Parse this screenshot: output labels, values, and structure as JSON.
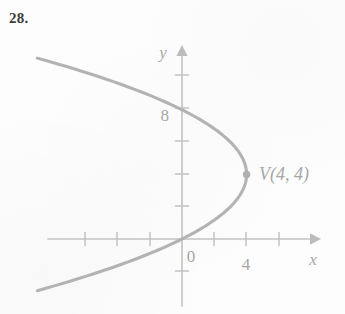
{
  "figure": {
    "exercise_number": "28.",
    "background_color": "#fdfdfd",
    "curve_color": "#b3b3b3",
    "axis_color": "#c2c2c2",
    "text_color": "#a6a6a6",
    "number_color": "#3c3c3c"
  },
  "axes": {
    "x_label": "x",
    "y_label": "y",
    "origin_label": "0",
    "x_tick_label": "4",
    "y_tick_label": "8",
    "x_range": [
      -8,
      8
    ],
    "y_range": [
      -4,
      12
    ],
    "tick_interval": 2,
    "grid": false,
    "arrowheads": [
      "x-positive",
      "y-positive"
    ]
  },
  "annotations": [
    {
      "name": "vertex",
      "label": "V(4, 4)",
      "x": 4,
      "y": 4,
      "marker": "dot"
    }
  ],
  "chart_data": {
    "type": "line",
    "title": "",
    "subtitle": "",
    "xlabel": "x",
    "ylabel": "y",
    "xlim": [
      -8,
      8
    ],
    "ylim": [
      -4,
      12
    ],
    "grid": false,
    "legend": "none",
    "tick_labels": {
      "x": [
        "0",
        "4"
      ],
      "y": [
        "8"
      ]
    },
    "curve": {
      "name": "leftward parabola with vertex V(4, 4)",
      "equation": "x = 4 - (1/4)(y - 4)^2",
      "orientation": "opens-left",
      "vertex": [
        4,
        4
      ],
      "y_intercepts": [
        0,
        8
      ],
      "x_intercept": 0,
      "points": [
        [
          -8.0,
          -3.0
        ],
        [
          -5.1,
          -2.0
        ],
        [
          -2.3,
          -1.0
        ],
        [
          0.0,
          0.0
        ],
        [
          1.8,
          1.0
        ],
        [
          3.0,
          2.0
        ],
        [
          3.8,
          3.0
        ],
        [
          4.0,
          4.0
        ],
        [
          3.8,
          5.0
        ],
        [
          3.0,
          6.0
        ],
        [
          1.8,
          7.0
        ],
        [
          0.0,
          8.0
        ],
        [
          -2.3,
          9.0
        ],
        [
          -5.1,
          10.0
        ],
        [
          -8.0,
          11.0
        ]
      ]
    },
    "annotations": [
      {
        "text": "V(4, 4)",
        "x": 4,
        "y": 4
      }
    ]
  }
}
